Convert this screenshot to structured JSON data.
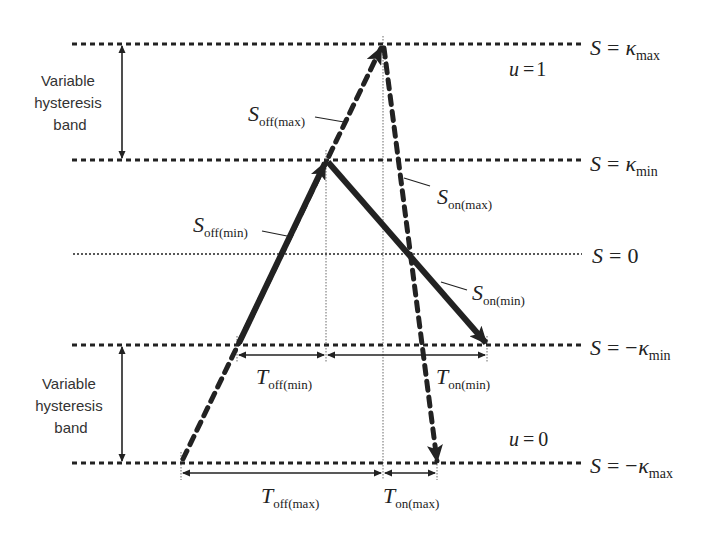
{
  "diagram": {
    "type": "variable-hysteresis-band-switching",
    "band_label_top": [
      "Variable",
      "hysteresis",
      "band"
    ],
    "band_label_bottom": [
      "Variable",
      "hysteresis",
      "band"
    ],
    "levels": [
      {
        "id": "k_max",
        "label_lhs": "S",
        "label_eq": "=",
        "label_sym": "κ",
        "label_sub": "max",
        "y": 44
      },
      {
        "id": "k_min",
        "label_lhs": "S",
        "label_eq": "=",
        "label_sym": "κ",
        "label_sub": "min",
        "y": 160
      },
      {
        "id": "zero",
        "label_lhs": "S",
        "label_eq": "=",
        "label_sym": "0",
        "label_sub": "",
        "y": 254
      },
      {
        "id": "neg_k_min",
        "label_lhs": "S",
        "label_eq": "=",
        "label_sym": "−κ",
        "label_sub": "min",
        "y": 345
      },
      {
        "id": "neg_k_max",
        "label_lhs": "S",
        "label_eq": "=",
        "label_sym": "−κ",
        "label_sub": "max",
        "y": 463
      }
    ],
    "state_labels": {
      "u_on": {
        "var": "u",
        "eq": "=",
        "val": "1"
      },
      "u_off": {
        "var": "u",
        "eq": "=",
        "val": "0"
      }
    },
    "slopes": {
      "s_off_max": {
        "main": "S",
        "sub": "off(max)"
      },
      "s_off_min": {
        "main": "S",
        "sub": "off(min)"
      },
      "s_on_max": {
        "main": "S",
        "sub": "on(max)"
      },
      "s_on_min": {
        "main": "S",
        "sub": "on(min)"
      }
    },
    "intervals": {
      "t_off_min": {
        "main": "T",
        "sub": "off(min)"
      },
      "t_on_min": {
        "main": "T",
        "sub": "on(min)"
      },
      "t_off_max": {
        "main": "T",
        "sub": "off(max)"
      },
      "t_on_max": {
        "main": "T",
        "sub": "on(max)"
      }
    },
    "colors": {
      "line": "#222222",
      "text": "#333333",
      "background": "#ffffff"
    }
  }
}
